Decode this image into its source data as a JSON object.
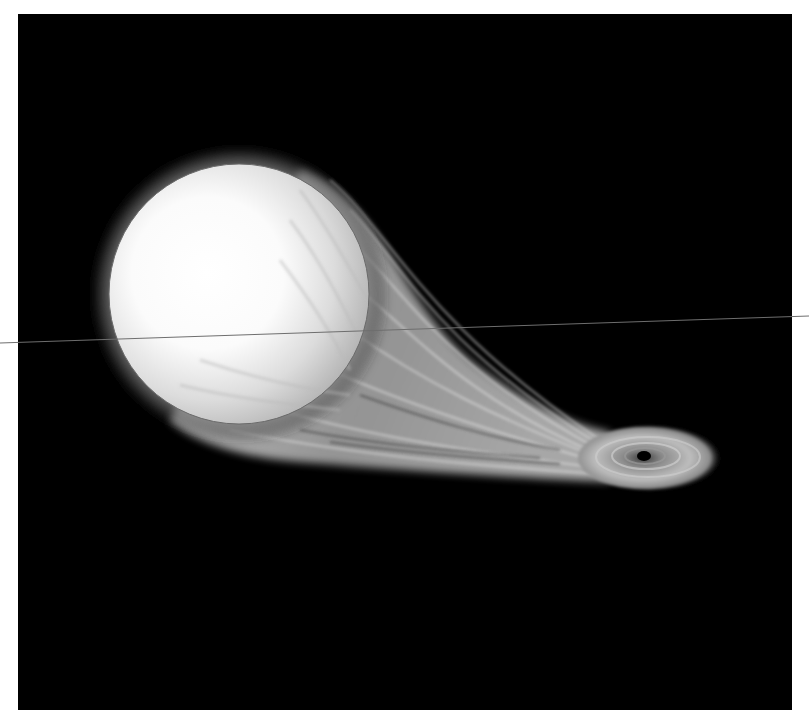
{
  "image": {
    "description": "Artist illustration of a star being tidally disrupted, with a stream of gas flowing into an accretion disk around a black hole",
    "background_color": "#000000",
    "margin_color": "#ffffff"
  },
  "scene": {
    "star": {
      "label": "donor star",
      "center": [
        239,
        294
      ],
      "radius": 130,
      "core_color": "#ffffff",
      "edge_color": "#b8b8b8",
      "glow_color": "#7a7a7a"
    },
    "stream": {
      "label": "gas stream",
      "color": "#a9a9a9"
    },
    "accretion_disk": {
      "label": "accretion disk",
      "center": [
        644,
        456
      ],
      "rx": 68,
      "ry": 28,
      "color": "#9a9a9a"
    },
    "black_hole": {
      "label": "black hole",
      "center": [
        644,
        456
      ],
      "radius": 6,
      "color": "#000000"
    },
    "horizon_line": {
      "label": "thin line",
      "from": [
        0,
        343
      ],
      "to": [
        809,
        316
      ],
      "color": "#6e6e6e"
    }
  }
}
